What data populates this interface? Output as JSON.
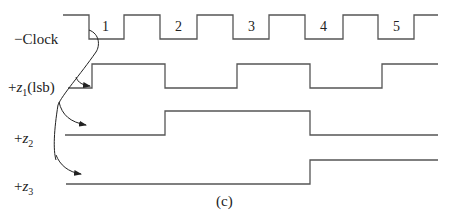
{
  "diagram": {
    "caption": "(c)",
    "signals": [
      {
        "id": "clock",
        "prefix": "−",
        "name": "Clock",
        "sub": "",
        "suffix": ""
      },
      {
        "id": "z1",
        "prefix": "+",
        "name": "z",
        "sub": "1",
        "suffix": "(lsb)"
      },
      {
        "id": "z2",
        "prefix": "+",
        "name": "z",
        "sub": "2",
        "suffix": ""
      },
      {
        "id": "z3",
        "prefix": "+",
        "name": "z",
        "sub": "3",
        "suffix": ""
      }
    ],
    "pulse_numbers": [
      "1",
      "2",
      "3",
      "4",
      "5"
    ],
    "colors": {
      "line": "#555555",
      "text": "#222222"
    }
  }
}
